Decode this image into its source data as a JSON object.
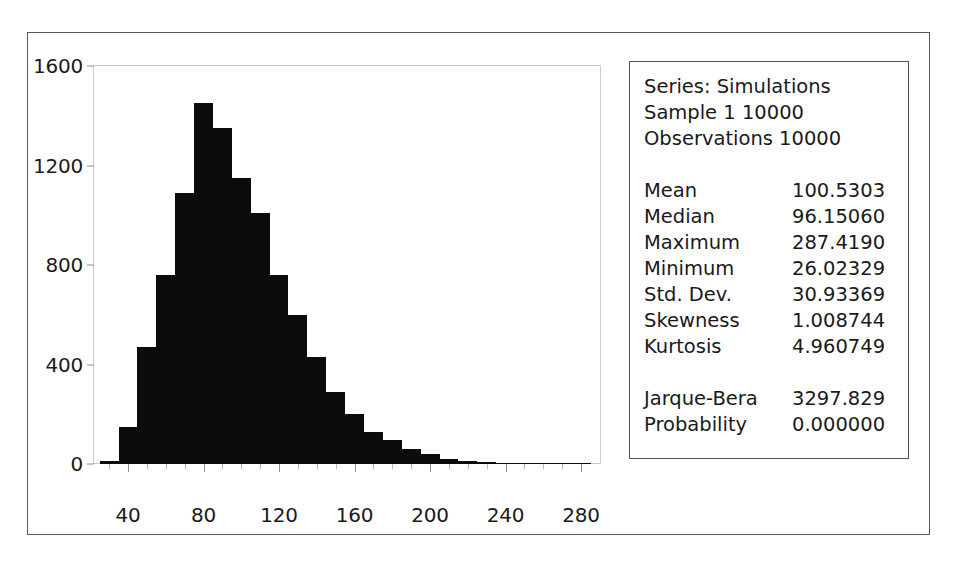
{
  "window": {
    "name": "eviews-histogram-output"
  },
  "stats_panel": {
    "header": [
      "Series: Simulations",
      "Sample 1 10000",
      "Observations 10000"
    ],
    "main_stats": [
      {
        "label": "Mean",
        "value": "100.5303"
      },
      {
        "label": "Median",
        "value": "96.15060"
      },
      {
        "label": "Maximum",
        "value": "287.4190"
      },
      {
        "label": "Minimum",
        "value": "26.02329"
      },
      {
        "label": "Std. Dev.",
        "value": "30.93369"
      },
      {
        "label": "Skewness",
        "value": "1.008744"
      },
      {
        "label": "Kurtosis",
        "value": "4.960749"
      }
    ],
    "test_stats": [
      {
        "label": "Jarque-Bera",
        "value": "3297.829"
      },
      {
        "label": "Probability",
        "value": "0.000000"
      }
    ]
  },
  "chart_data": {
    "type": "bar",
    "title": "",
    "subtitle": "",
    "xlabel": "",
    "ylabel": "",
    "grid": false,
    "legend": false,
    "bar_color": "#0b0b0b",
    "xlim": [
      22,
      290
    ],
    "ylim": [
      0,
      1600
    ],
    "x_tick_labels": [
      "40",
      "80",
      "120",
      "160",
      "200",
      "240",
      "280"
    ],
    "x_tick_values": [
      40,
      80,
      120,
      160,
      200,
      240,
      280
    ],
    "x_minor_tick_step": 10,
    "y_tick_labels": [
      "0",
      "400",
      "800",
      "1200",
      "1600"
    ],
    "y_tick_values": [
      0,
      400,
      800,
      1200,
      1600
    ],
    "bin_width": 10,
    "categories": [
      "25-35",
      "35-45",
      "45-55",
      "55-65",
      "65-75",
      "75-85",
      "85-95",
      "95-105",
      "105-115",
      "115-125",
      "125-135",
      "135-145",
      "145-155",
      "155-165",
      "165-175",
      "175-185",
      "185-195",
      "195-205",
      "205-215",
      "215-225",
      "225-235",
      "235-245",
      "245-255",
      "255-265",
      "265-275",
      "275-285"
    ],
    "bin_centers": [
      30,
      40,
      50,
      60,
      70,
      80,
      90,
      100,
      110,
      120,
      130,
      140,
      150,
      160,
      170,
      180,
      190,
      200,
      210,
      220,
      230,
      240,
      250,
      260,
      270,
      280
    ],
    "values": [
      12,
      150,
      470,
      760,
      1090,
      1450,
      1350,
      1150,
      1010,
      760,
      600,
      430,
      290,
      200,
      130,
      95,
      60,
      40,
      22,
      14,
      8,
      5,
      3,
      2,
      1,
      1
    ]
  }
}
